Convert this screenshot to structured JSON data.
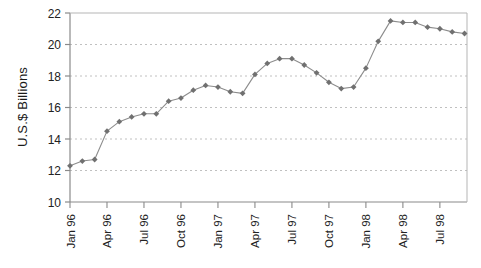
{
  "chart_data": {
    "type": "line",
    "title": "",
    "xlabel": "",
    "ylabel": "U.S.$ Billions",
    "ylim": [
      10,
      22
    ],
    "ytick_values": [
      10,
      12,
      14,
      16,
      18,
      20,
      22
    ],
    "ytick_labels": [
      "10",
      "12",
      "14",
      "16",
      "18",
      "20",
      "22"
    ],
    "xtick_labels": [
      "Jan 96",
      "Apr 96",
      "Jul 96",
      "Oct 96",
      "Jan 97",
      "Apr 97",
      "Jul 97",
      "Oct 97",
      "Jan 98",
      "Apr 98",
      "Jul 98"
    ],
    "grid": "horizontal-dashed",
    "legend": "none",
    "marker": "diamond",
    "series_color": "#707070",
    "x": [
      "Jan 96",
      "Feb 96",
      "Mar 96",
      "Apr 96",
      "May 96",
      "Jun 96",
      "Jul 96",
      "Aug 96",
      "Sep 96",
      "Oct 96",
      "Nov 96",
      "Dec 96",
      "Jan 97",
      "Feb 97",
      "Mar 97",
      "Apr 97",
      "May 97",
      "Jun 97",
      "Jul 97",
      "Aug 97",
      "Sep 97",
      "Oct 97",
      "Nov 97",
      "Dec 97",
      "Jan 98",
      "Feb 98",
      "Mar 98",
      "Apr 98",
      "May 98",
      "Jun 98",
      "Jul 98",
      "Aug 98",
      "Sep 98"
    ],
    "values": [
      12.3,
      12.6,
      12.7,
      14.5,
      15.1,
      15.4,
      15.6,
      15.6,
      16.4,
      16.6,
      17.1,
      17.4,
      17.3,
      17.0,
      16.9,
      18.1,
      18.8,
      19.1,
      19.1,
      18.7,
      18.2,
      17.6,
      17.2,
      17.3,
      18.5,
      20.2,
      21.5,
      21.4,
      21.4,
      21.1,
      21.0,
      20.8,
      20.7
    ]
  },
  "axis": {
    "y_label": "U.S.$ Billions"
  }
}
